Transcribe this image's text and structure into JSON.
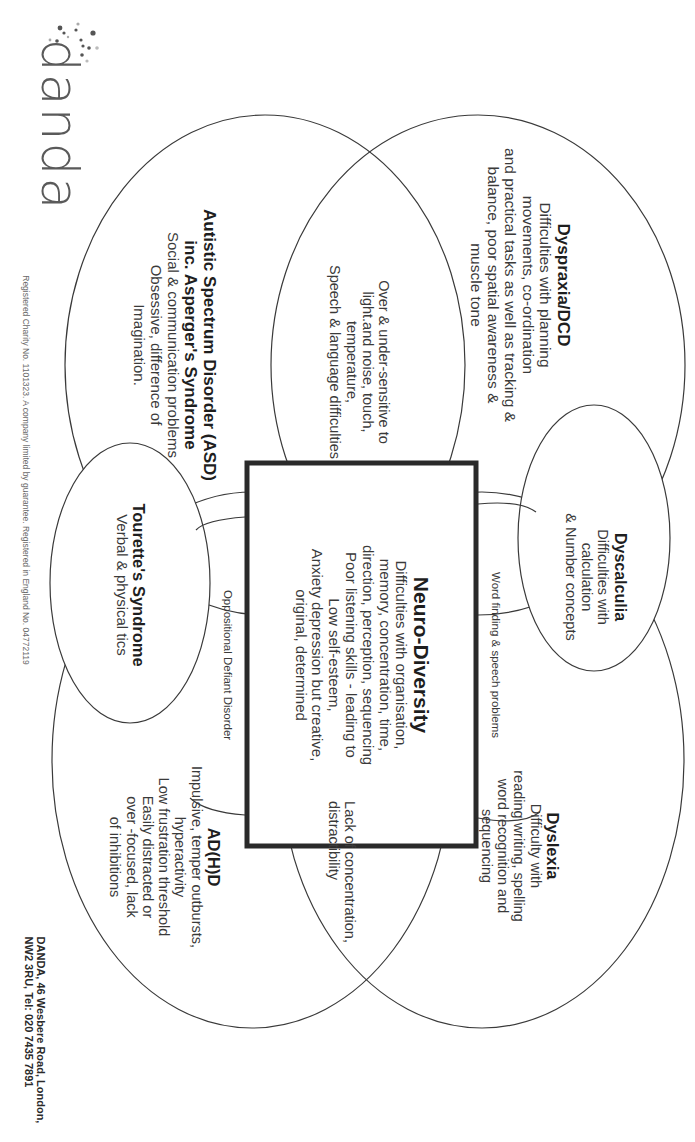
{
  "logo": {
    "text": "danda",
    "icon": "sparkle-dots-icon"
  },
  "center": {
    "title": "Neuro-Diversity",
    "lines": [
      "Difficulties with organisation,",
      "memory, concentration, time,",
      "direction, perception, sequencing",
      "Poor listening skills - leading to",
      "Low self-esteem,",
      "Anxiety depression but creative,",
      "original, determined"
    ]
  },
  "dyspraxia": {
    "title": "Dyspraxia/DCD",
    "lines": [
      "Difficulties with planning",
      "movements, co-ordination",
      "and practical tasks as well as tracking &",
      "balance, poor spatial awareness &",
      "muscle tone"
    ]
  },
  "asd": {
    "title_line1": "Autistic Spectrum Disorder (ASD)",
    "title_line2": "inc. Asperger's Syndrome",
    "lines": [
      "Social & communication problems",
      "Obsessive, difference of",
      "Imagination."
    ]
  },
  "sensory": {
    "lines": [
      "Over & under-sensitive to",
      "light.and noise, touch,",
      "temperature,",
      "Speech & language difficulties"
    ]
  },
  "dyscalculia": {
    "title": "Dyscalculia",
    "lines": [
      "Difficulties with",
      "calculation",
      "& Number concepts"
    ]
  },
  "word_finding": {
    "text": "Word finding & speech problems"
  },
  "tourettes": {
    "title": "Tourette's Syndrome",
    "lines": [
      "Verbal & physical tics"
    ]
  },
  "odd": {
    "text": "Oppositional Defiant Disorder"
  },
  "dyslexia": {
    "title": "Dyslexia",
    "lines": [
      "Difficulty with",
      "reading writing, spelling",
      "word recognition and",
      "sequencing"
    ]
  },
  "concentration": {
    "lines": [
      "Lack of concentration,",
      "distractibility"
    ]
  },
  "adhd": {
    "title": "AD(H)D",
    "lines": [
      "Impulsive, temper outbursts,",
      "hyperactivity",
      "Low frustration threshold",
      "Easily distracted or",
      "over -focused, lack",
      "of inhibitions"
    ]
  },
  "footer": {
    "registration": "Registered Charity No. 1101323.  A company limited by guarantee. Registered in England No. 04772119",
    "address_line1": "DANDA, 46 Wesbere Road, London,",
    "address_line2": "NW2 3RU,  Tel: 020 7435 7891"
  }
}
